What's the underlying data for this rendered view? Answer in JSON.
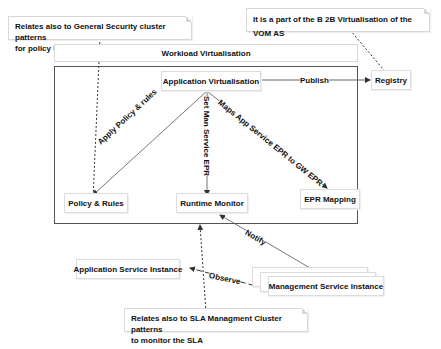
{
  "notes": {
    "security": {
      "line1": "Relates also to General Security cluster patterns",
      "line2": "for policy like PDP , PEP factory  patterns"
    },
    "b2b": {
      "line1": "It is a part of the B 2B Virtualisation of the VOM AS"
    },
    "sla": {
      "line1": "Relates also to SLA Managment Cluster patterns",
      "line2": "to monitor the SLA"
    }
  },
  "frame": {
    "title": "Workload Virtualisation"
  },
  "nodes": {
    "app_virtualisation": "Application Virtualisation",
    "registry": "Registry",
    "policy_rules": "Policy & Rules",
    "runtime_monitor": "Runtime Monitor",
    "epr_mapping": "EPR Mapping",
    "app_service_instance": "Application Service Instance",
    "mgmt_service_instance": "Management Service Instance"
  },
  "edges": {
    "publish": "Publish",
    "apply_policy": "Apply Policy & rules",
    "set_man_service": "Set Man Service EPR",
    "maps_app_service": "Maps App Service EPR to GW EPR",
    "notify": "Notify",
    "observe": "Observe"
  },
  "colors": {
    "line": "#555555",
    "frame": "#555555",
    "box_border": "#dcdcdc"
  }
}
